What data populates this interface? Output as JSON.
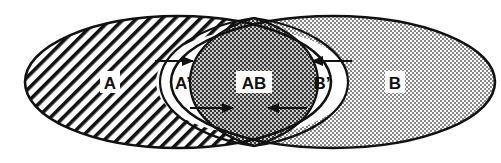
{
  "diagram": {
    "type": "venn-with-inner-regions",
    "regions": [
      {
        "id": "A",
        "label": "A",
        "fill": "diagonal-hatch"
      },
      {
        "id": "A_prime",
        "label": "A’",
        "fill": "white"
      },
      {
        "id": "AB",
        "label": "AB",
        "fill": "dense-dots"
      },
      {
        "id": "B_prime",
        "label": "B’",
        "fill": "white"
      },
      {
        "id": "B",
        "label": "B",
        "fill": "light-dots"
      }
    ],
    "arrows": [
      {
        "id": "arrow-top-left",
        "direction": "right"
      },
      {
        "id": "arrow-bottom-left",
        "direction": "right"
      },
      {
        "id": "arrow-top-right",
        "direction": "left"
      },
      {
        "id": "arrow-bottom-right",
        "direction": "left"
      }
    ],
    "colors": {
      "stroke": "#111111",
      "background": "#ffffff",
      "dots": "#555555"
    }
  }
}
